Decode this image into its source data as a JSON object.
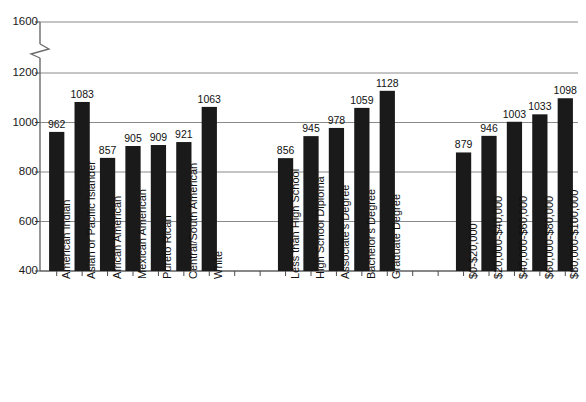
{
  "chart_data": {
    "type": "bar",
    "title": "",
    "subtitle": "",
    "xlabel": "",
    "ylabel": "",
    "ylim": [
      400,
      1600
    ],
    "yticks": [
      400,
      600,
      800,
      1000,
      1200,
      1600
    ],
    "ytick_labels": [
      "400",
      "600",
      "800",
      "1000",
      "1200",
      "1600"
    ],
    "axis_break": {
      "present": true,
      "between": [
        1200,
        1600
      ],
      "symbol": "zigzag"
    },
    "grid": true,
    "grid_axis": "y",
    "legend": "none",
    "bar_color": "#1a1a1a",
    "groups": [
      {
        "name": "Race/Ethnicity",
        "categories": [
          "American Indian",
          "Asian or Pacific Islander",
          "African American",
          "Mexican American",
          "Pureto Rican",
          "Central/South American",
          "White"
        ],
        "values": [
          962,
          1083,
          857,
          905,
          909,
          921,
          1063
        ]
      },
      {
        "name": "Education",
        "categories": [
          "Less than High School",
          "High School Diploma",
          "Associate's Degree",
          "Bachelor's Degree",
          "Graduate Degree"
        ],
        "values": [
          856,
          945,
          978,
          1059,
          1128
        ]
      },
      {
        "name": "Income",
        "categories": [
          "$0-$20,000",
          "$20,000-$40,000",
          "$40,000-$60,000",
          "$60,000-$80,000",
          "$80,000-$100,000"
        ],
        "values": [
          879,
          946,
          1003,
          1033,
          1098
        ]
      }
    ],
    "categories": [
      "American Indian",
      "Asian or Pacific Islander",
      "African American",
      "Mexican American",
      "Pureto Rican",
      "Central/South American",
      "White",
      "Less than High School",
      "High School Diploma",
      "Associate's Degree",
      "Bachelor's Degree",
      "Graduate Degree",
      "$0-$20,000",
      "$20,000-$40,000",
      "$40,000-$60,000",
      "$60,000-$80,000",
      "$80,000-$100,000"
    ],
    "values": [
      962,
      1083,
      857,
      905,
      909,
      921,
      1063,
      856,
      945,
      978,
      1059,
      1128,
      879,
      946,
      1003,
      1033,
      1098
    ]
  }
}
